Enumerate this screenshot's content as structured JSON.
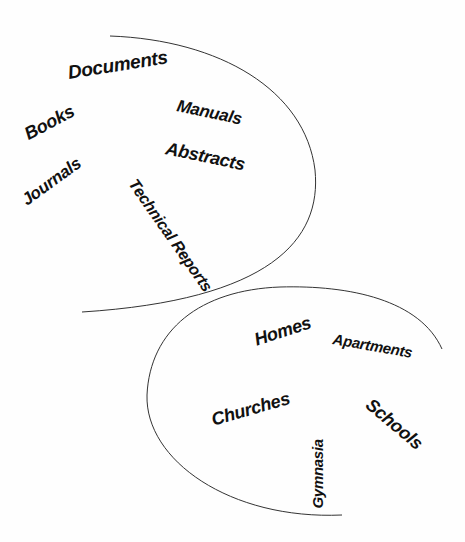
{
  "diagram": {
    "groups": [
      {
        "name": "documents-group",
        "words": [
          {
            "label": "Documents"
          },
          {
            "label": "Manuals"
          },
          {
            "label": "Books"
          },
          {
            "label": "Abstracts"
          },
          {
            "label": "Journals"
          },
          {
            "label": "Technical Reports"
          }
        ]
      },
      {
        "name": "buildings-group",
        "words": [
          {
            "label": "Homes"
          },
          {
            "label": "Apartments"
          },
          {
            "label": "Churches"
          },
          {
            "label": "Schools"
          },
          {
            "label": "Gymnasia"
          }
        ]
      }
    ],
    "colors": {
      "stroke": "#333333",
      "text": "#111111",
      "background": "#fefefe"
    }
  }
}
